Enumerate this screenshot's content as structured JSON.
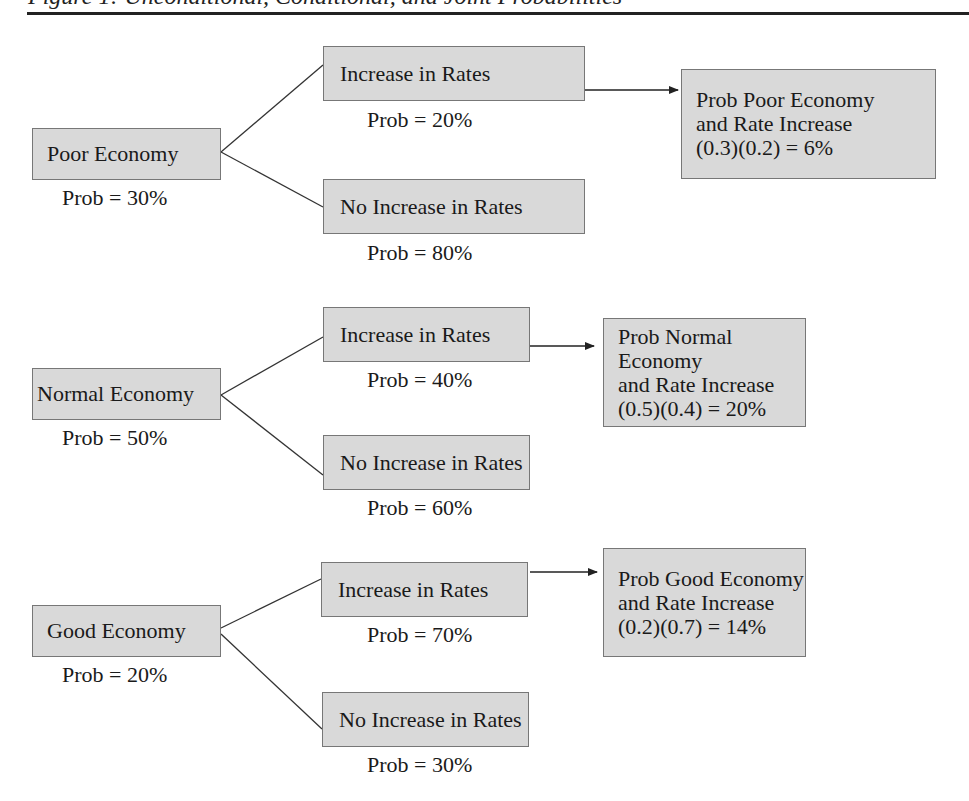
{
  "figure": {
    "title": "Figure 1: Unconditional, Conditional, and Joint Probabilities"
  },
  "colors": {
    "box_fill": "#d9d9d9",
    "box_border": "#777777",
    "line": "#333333"
  },
  "branches": [
    {
      "economy": {
        "label": "Poor Economy",
        "prob": "Prob = 30%"
      },
      "increase": {
        "label": "Increase in Rates",
        "prob": "Prob = 20%"
      },
      "no_increase": {
        "label": "No Increase in Rates",
        "prob": "Prob = 80%"
      },
      "joint": {
        "line1": "Prob Poor Economy",
        "line2": "and Rate Increase",
        "line3": "(0.3)(0.2) = 6%"
      }
    },
    {
      "economy": {
        "label": "Normal Economy",
        "prob": "Prob = 50%"
      },
      "increase": {
        "label": "Increase in Rates",
        "prob": "Prob = 40%"
      },
      "no_increase": {
        "label": "No Increase in Rates",
        "prob": "Prob = 60%"
      },
      "joint": {
        "line1": "Prob Normal Economy",
        "line2": "and Rate Increase",
        "line3": "(0.5)(0.4) = 20%"
      }
    },
    {
      "economy": {
        "label": "Good Economy",
        "prob": "Prob = 20%"
      },
      "increase": {
        "label": "Increase in Rates",
        "prob": "Prob = 70%"
      },
      "no_increase": {
        "label": "No Increase in Rates",
        "prob": "Prob = 30%"
      },
      "joint": {
        "line1": "Prob Good Economy",
        "line2": "and Rate Increase",
        "line3": "(0.2)(0.7) = 14%"
      }
    }
  ]
}
